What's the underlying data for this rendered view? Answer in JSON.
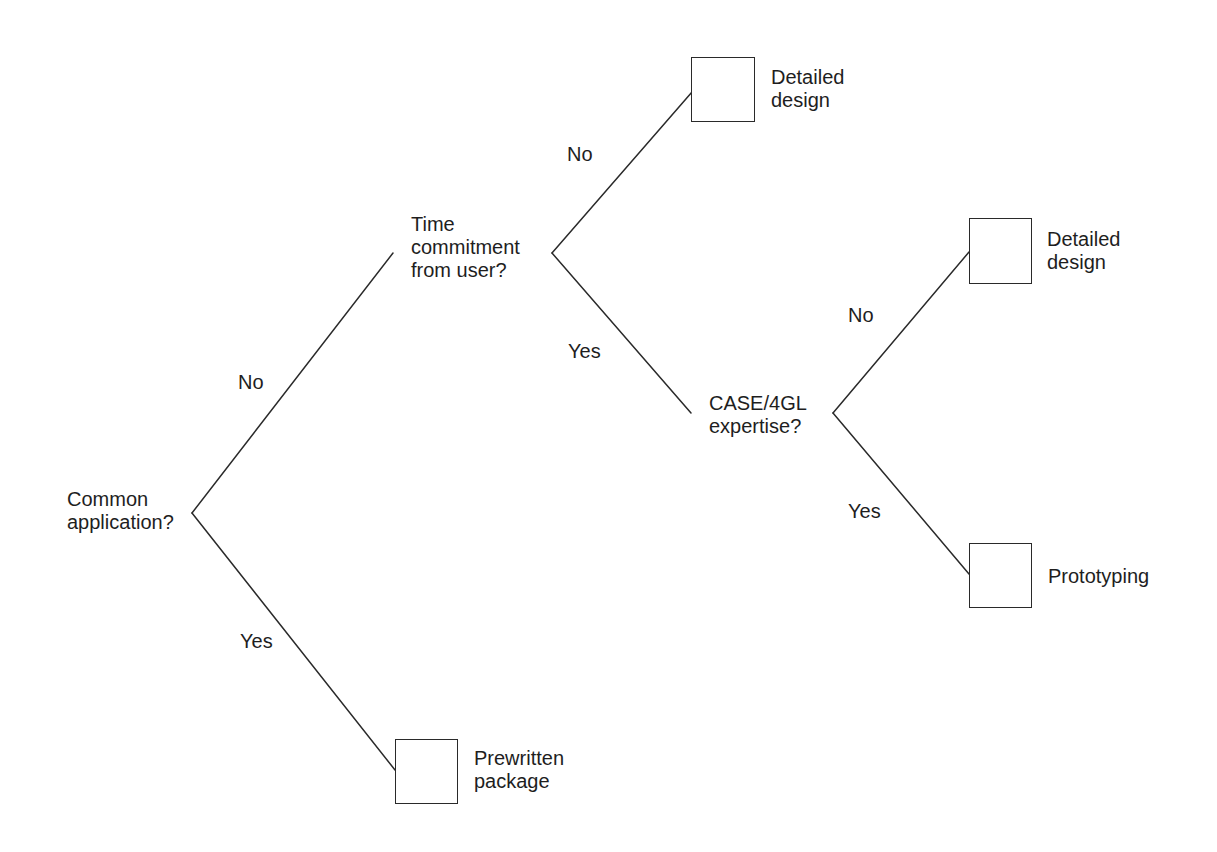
{
  "diagram": {
    "type": "decision-tree",
    "nodes": {
      "root": {
        "label": "Common\napplication?"
      },
      "time": {
        "label": "Time\ncommitment\nfrom user?"
      },
      "case": {
        "label": "CASE/4GL\nexpertise?"
      }
    },
    "outcomes": {
      "detailed_design_1": {
        "label": "Detailed\ndesign"
      },
      "detailed_design_2": {
        "label": "Detailed\ndesign"
      },
      "prototyping": {
        "label": "Prototyping"
      },
      "prewritten": {
        "label": "Prewritten\npackage"
      }
    },
    "edges": {
      "root_no": {
        "label": "No",
        "from": "root",
        "to": "time"
      },
      "root_yes": {
        "label": "Yes",
        "from": "root",
        "to": "prewritten"
      },
      "time_no": {
        "label": "No",
        "from": "time",
        "to": "detailed_design_1"
      },
      "time_yes": {
        "label": "Yes",
        "from": "time",
        "to": "case"
      },
      "case_no": {
        "label": "No",
        "from": "case",
        "to": "detailed_design_2"
      },
      "case_yes": {
        "label": "Yes",
        "from": "case",
        "to": "prototyping"
      }
    },
    "colors": {
      "line": "#2a2a2a",
      "text": "#1e1e1e",
      "background": "#ffffff"
    }
  }
}
